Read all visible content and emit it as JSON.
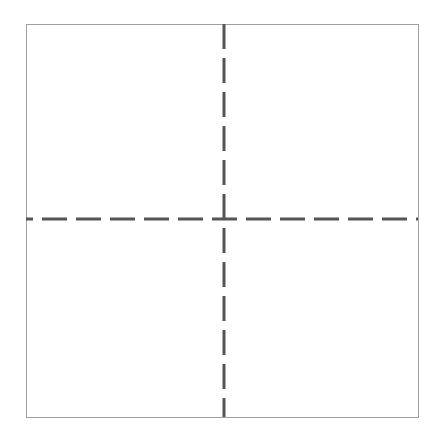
{
  "diagram": {
    "type": "quadrant-grid",
    "background": "#ffffff",
    "frame": {
      "x": 26,
      "y": 24,
      "width": 392,
      "height": 393,
      "stroke": "#a0a0a0",
      "stroke_width": 1
    },
    "divider_color": "#555555",
    "divider_width": 3,
    "dash_pattern": "25 9",
    "vertical_divider_x": 224,
    "horizontal_divider_y": 219,
    "quadrants": [
      {
        "position": "top-left",
        "label": ""
      },
      {
        "position": "top-right",
        "label": ""
      },
      {
        "position": "bottom-left",
        "label": ""
      },
      {
        "position": "bottom-right",
        "label": ""
      }
    ]
  }
}
